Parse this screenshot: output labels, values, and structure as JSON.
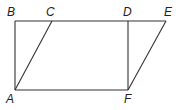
{
  "diagram": {
    "points": {
      "A": {
        "label": "A",
        "x": 15,
        "y": 90
      },
      "B": {
        "label": "B",
        "x": 15,
        "y": 21
      },
      "C": {
        "label": "C",
        "x": 52,
        "y": 21
      },
      "D": {
        "label": "D",
        "x": 128,
        "y": 21
      },
      "E": {
        "label": "E",
        "x": 166,
        "y": 21
      },
      "F": {
        "label": "F",
        "x": 128,
        "y": 90
      }
    },
    "segments": [
      [
        "B",
        "E"
      ],
      [
        "A",
        "F"
      ],
      [
        "A",
        "B"
      ],
      [
        "D",
        "F"
      ],
      [
        "A",
        "C"
      ],
      [
        "F",
        "E"
      ]
    ],
    "colors": {
      "line": "#333333",
      "text": "#222222",
      "background": "#ffffff"
    }
  }
}
